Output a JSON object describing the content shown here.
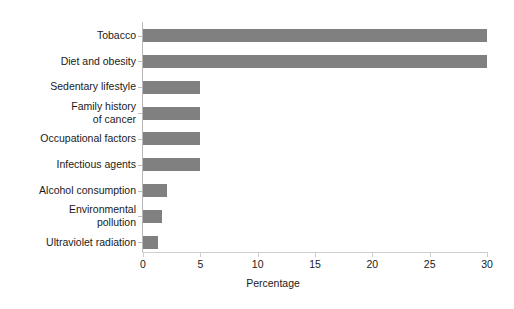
{
  "chart_data": {
    "type": "bar",
    "orientation": "horizontal",
    "title": "",
    "subtitle": "",
    "xlabel": "Percentage",
    "ylabel": "",
    "xlim": [
      0,
      30
    ],
    "ylim": null,
    "grid": false,
    "legend": null,
    "legend_position": "none",
    "bar_color": "#808080",
    "axis_color": "#bdbdbd",
    "text_color": "#1a1a1a",
    "background": "#ffffff",
    "xticks": [
      0,
      5,
      10,
      15,
      20,
      25,
      30
    ],
    "xtick_labels": [
      "0",
      "5",
      "10",
      "15",
      "20",
      "25",
      "30"
    ],
    "categories": [
      "Tobacco",
      "Diet and obesity",
      "Sedentary lifestyle",
      "Family history\nof cancer",
      "Occupational factors",
      "Infectious agents",
      "Alcohol consumption",
      "Environmental\npollution",
      "Ultraviolet radiation"
    ],
    "values": [
      30,
      30,
      5,
      5,
      5,
      5,
      2.1,
      1.7,
      1.3
    ],
    "annotations": []
  }
}
